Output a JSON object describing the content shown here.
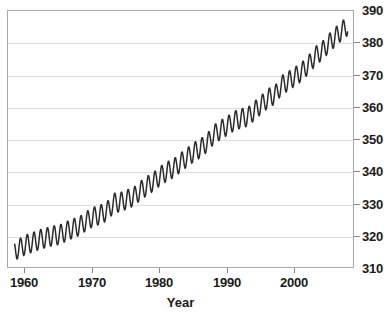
{
  "chart_data": {
    "type": "line",
    "title": "",
    "subtitle": "",
    "xlabel": "Year",
    "ylabel": "",
    "xlim": [
      1957.5,
      2008.8
    ],
    "ylim": [
      310,
      390
    ],
    "grid": true,
    "legend": null,
    "y_axis_position": "right",
    "xticks": [
      1960,
      1970,
      1980,
      1990,
      2000
    ],
    "xtick_labels": [
      "1960",
      "1970",
      "1980",
      "1990",
      "2000"
    ],
    "yticks": [
      310,
      320,
      330,
      340,
      350,
      360,
      370,
      380,
      390
    ],
    "ytick_labels": [
      "310",
      "320",
      "330",
      "340",
      "350",
      "360",
      "370",
      "380",
      "390"
    ],
    "series": [
      {
        "name": "Monthly mean CO2",
        "color": "#2b2b2b",
        "seasonal_amplitude": 3.1,
        "x": [
          1958.5,
          1959.0,
          1959.5,
          1960.0,
          1960.5,
          1961.0,
          1961.5,
          1962.0,
          1962.5,
          1963.0,
          1963.5,
          1964.0,
          1964.5,
          1965.0,
          1965.5,
          1966.0,
          1966.5,
          1967.0,
          1967.5,
          1968.0,
          1968.5,
          1969.0,
          1969.5,
          1970.0,
          1970.5,
          1971.0,
          1971.5,
          1972.0,
          1972.5,
          1973.0,
          1973.5,
          1974.0,
          1974.5,
          1975.0,
          1975.5,
          1976.0,
          1976.5,
          1977.0,
          1977.5,
          1978.0,
          1978.5,
          1979.0,
          1979.5,
          1980.0,
          1980.5,
          1981.0,
          1981.5,
          1982.0,
          1982.5,
          1983.0,
          1983.5,
          1984.0,
          1984.5,
          1985.0,
          1985.5,
          1986.0,
          1986.5,
          1987.0,
          1987.5,
          1988.0,
          1988.5,
          1989.0,
          1989.5,
          1990.0,
          1990.5,
          1991.0,
          1991.5,
          1992.0,
          1992.5,
          1993.0,
          1993.5,
          1994.0,
          1994.5,
          1995.0,
          1995.5,
          1996.0,
          1996.5,
          1997.0,
          1997.5,
          1998.0,
          1998.5,
          1999.0,
          1999.5,
          2000.0,
          2000.5,
          2001.0,
          2001.5,
          2002.0,
          2002.5,
          2003.0,
          2003.5,
          2004.0,
          2004.5,
          2005.0,
          2005.5,
          2006.0,
          2006.5,
          2007.0,
          2007.5,
          2008.0
        ],
        "values": [
          315.0,
          315.8,
          316.1,
          316.9,
          317.2,
          317.6,
          318.0,
          318.4,
          318.8,
          319.0,
          319.4,
          319.6,
          319.9,
          320.0,
          320.4,
          321.0,
          321.4,
          322.0,
          322.2,
          322.9,
          323.1,
          324.4,
          324.6,
          325.6,
          325.8,
          326.3,
          326.5,
          327.4,
          327.8,
          329.6,
          330.2,
          330.2,
          330.4,
          331.1,
          331.3,
          332.0,
          332.2,
          333.8,
          334.1,
          335.3,
          335.6,
          336.7,
          337.0,
          338.5,
          338.8,
          339.8,
          340.1,
          341.0,
          341.2,
          342.6,
          343.0,
          344.3,
          344.6,
          345.9,
          346.2,
          347.2,
          347.5,
          349.0,
          349.4,
          351.5,
          351.8,
          352.9,
          353.2,
          354.2,
          354.5,
          355.6,
          355.9,
          356.4,
          356.6,
          357.0,
          357.3,
          358.8,
          359.2,
          360.8,
          361.1,
          362.6,
          363.0,
          363.8,
          364.2,
          366.7,
          367.1,
          368.0,
          368.4,
          369.5,
          369.8,
          371.0,
          371.4,
          373.2,
          373.6,
          375.8,
          376.2,
          377.5,
          377.8,
          379.8,
          380.2,
          381.9,
          382.3,
          383.8,
          384.2,
          385.6
        ]
      }
    ],
    "annotations": []
  },
  "axes": {
    "x_title": "Year",
    "y_title": ""
  }
}
